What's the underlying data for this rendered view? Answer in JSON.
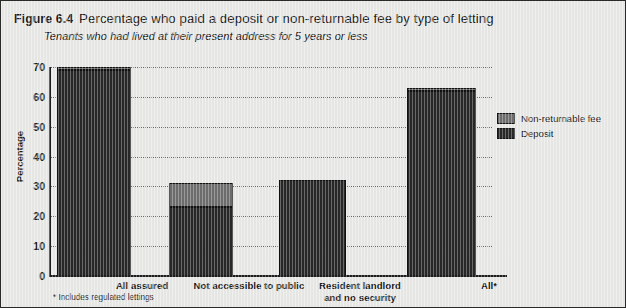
{
  "figure": {
    "number": "Figure 6.4",
    "title": "Percentage who paid a deposit or non-returnable fee by type of letting",
    "subtitle": "Tenants who had lived at their present address for 5 years or less",
    "footnote": "* Includes regulated lettings"
  },
  "legend": {
    "items": [
      {
        "label": "Non-returnable fee",
        "color": "#6e6e6e"
      },
      {
        "label": "Deposit",
        "color": "#282828"
      }
    ]
  },
  "chart_data": {
    "type": "bar",
    "stacked": true,
    "title": "Percentage who paid a deposit or non-returnable fee by type of letting",
    "subtitle": "Tenants who had lived at their present address for 5 years or less",
    "xlabel": "",
    "ylabel": "Percentage",
    "ylim": [
      0,
      70
    ],
    "yticks": [
      0,
      10,
      20,
      30,
      40,
      50,
      60,
      70
    ],
    "ytick_labels": [
      "0",
      "10",
      "20",
      "30",
      "40",
      "50",
      "60",
      "70"
    ],
    "grid": true,
    "legend_position": "right",
    "categories": [
      "All assured",
      "Not accessible to public",
      "Resident landlord and no security",
      "All*"
    ],
    "category_lines": [
      [
        "All assured"
      ],
      [
        "Not accessible to public"
      ],
      [
        "Resident landlord",
        "and no security"
      ],
      [
        "All*"
      ]
    ],
    "series": [
      {
        "name": "Deposit",
        "color": "#282828",
        "values": [
          69,
          23,
          32,
          62
        ]
      },
      {
        "name": "Non-returnable fee",
        "color": "#6e6e6e",
        "values": [
          1,
          8,
          0,
          1
        ]
      }
    ],
    "totals": [
      70,
      31,
      32,
      63
    ]
  }
}
